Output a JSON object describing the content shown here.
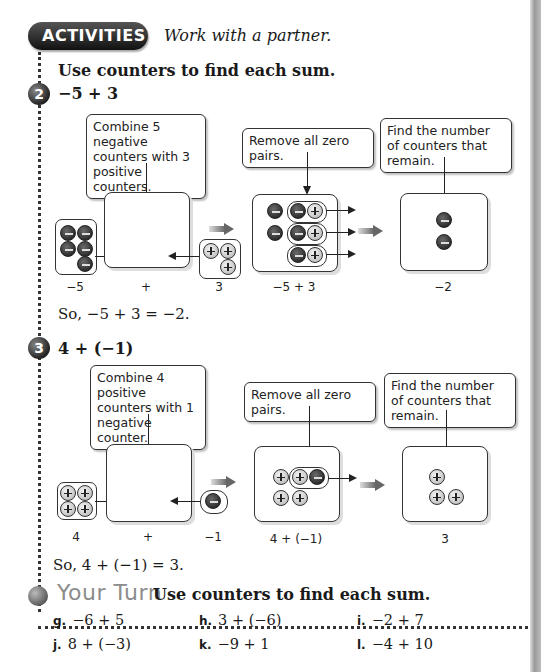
{
  "header": {
    "badge_label": "ACTIVITIES",
    "subtitle": "Work with a partner.",
    "instruction": "Use counters to find each sum."
  },
  "activities": [
    {
      "number": "2",
      "expression": "−5 + 3",
      "callouts": {
        "combine": "Combine 5 negative counters with 3 positive counters.",
        "remove": "Remove all zero pairs.",
        "remain": "Find the number of counters that remain."
      },
      "labels": {
        "left": "−5",
        "plus": "+",
        "right": "3",
        "middle": "−5 + 3",
        "result": "−2"
      },
      "conclusion": "So, −5 + 3 = −2."
    },
    {
      "number": "3",
      "expression": "4 + (−1)",
      "callouts": {
        "combine": "Combine 4 positive counters with 1 negative counter.",
        "remove": "Remove all zero pairs.",
        "remain": "Find the number of counters that remain."
      },
      "labels": {
        "left": "4",
        "plus": "+",
        "right": "−1",
        "middle": "4 + (−1)",
        "result": "3"
      },
      "conclusion": "So, 4 + (−1) = 3."
    }
  ],
  "your_turn": {
    "title": "Your Turn",
    "instruction": "Use counters to find each sum.",
    "exercises": [
      {
        "letter": "g.",
        "expr": "−6 + 5"
      },
      {
        "letter": "h.",
        "expr": "3 + (−6)"
      },
      {
        "letter": "i.",
        "expr": "−2 + 7"
      },
      {
        "letter": "j.",
        "expr": "8 + (−3)"
      },
      {
        "letter": "k.",
        "expr": "−9 + 1"
      },
      {
        "letter": "l.",
        "expr": "−4 + 10"
      }
    ]
  }
}
